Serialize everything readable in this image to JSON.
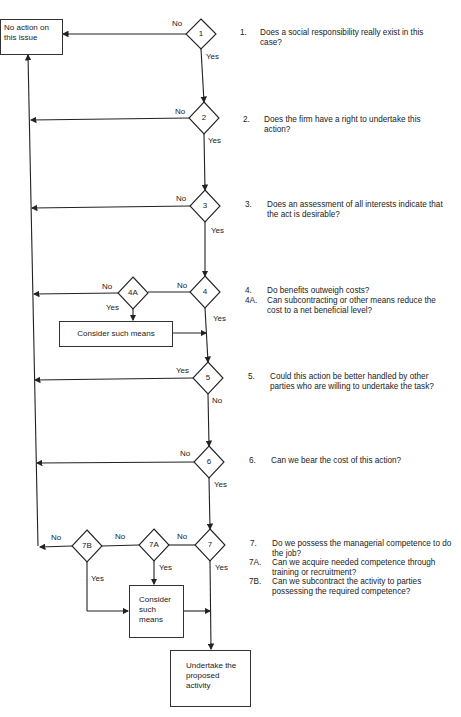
{
  "diagram": {
    "terminals": {
      "no_action": "No action on this issue",
      "undertake": "Undertake the proposed activity"
    },
    "process_boxes": {
      "consider_4a": "Consider such means",
      "consider_7": "Consider such means"
    },
    "decisions": [
      {
        "id": "1",
        "no": "No",
        "yes": "Yes"
      },
      {
        "id": "2",
        "no": "No",
        "yes": "Yes"
      },
      {
        "id": "3",
        "no": "No",
        "yes": "Yes"
      },
      {
        "id": "4",
        "no": "No",
        "yes": "Yes"
      },
      {
        "id": "4A",
        "no": "No",
        "yes": "Yes"
      },
      {
        "id": "5",
        "yes": "Yes",
        "no": "No"
      },
      {
        "id": "6",
        "no": "No",
        "yes": "Yes"
      },
      {
        "id": "7",
        "no": "No",
        "yes": "Yes"
      },
      {
        "id": "7A",
        "no": "No",
        "yes": "Yes"
      },
      {
        "id": "7B",
        "no": "No",
        "yes": "Yes"
      }
    ],
    "questions": [
      {
        "num": "1.",
        "text": "Does a social responsibility really exist in this case?"
      },
      {
        "num": "2.",
        "text": "Does the firm have a right to undertake this action?"
      },
      {
        "num": "3.",
        "text": "Does an assessment of all interests indicate that the act is desirable?"
      },
      {
        "num": "4.",
        "text": "Do benefits outweigh costs?"
      },
      {
        "num": "4A.",
        "text": "Can subcontracting or other means reduce the cost to a net beneficial level?"
      },
      {
        "num": "5.",
        "text": "Could this action be better handled by other parties who are willing to undertake the task?"
      },
      {
        "num": "6.",
        "text": "Can we bear the cost of this action?"
      },
      {
        "num": "7.",
        "text": "Do we possess the managerial competence to do the job?"
      },
      {
        "num": "7A.",
        "text": "Can we acquire needed competence through training or recruitment?"
      },
      {
        "num": "7B.",
        "text": "Can we subcontract the activity to parties possessing the required competence?"
      }
    ]
  }
}
